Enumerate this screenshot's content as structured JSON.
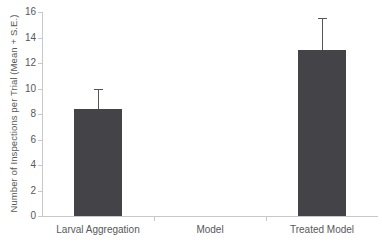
{
  "chart_data": {
    "type": "bar",
    "title": "",
    "xlabel": "",
    "ylabel": "Number of Inspections per Trial (Mean + S.E.)",
    "categories": [
      "Larval Aggregation",
      "Model",
      "Treated Model"
    ],
    "values": [
      8.4,
      0,
      13.0
    ],
    "errors": [
      1.6,
      0,
      2.5
    ],
    "ylim": [
      0,
      16
    ],
    "ytick_values": [
      0,
      2,
      4,
      6,
      8,
      10,
      12,
      14,
      16
    ],
    "ytick_labels": [
      "0",
      "2",
      "4",
      "6",
      "8",
      "10",
      "12",
      "14",
      "16"
    ],
    "grid": false,
    "legend": "none",
    "series": [
      {
        "name": "Number of Inspections per Trial",
        "values": [
          8.4,
          0,
          13.0
        ],
        "errors": [
          1.6,
          0,
          2.5
        ]
      }
    ],
    "colors": {
      "bar_fill": "#444448",
      "error_bar": "#555558",
      "axis": "#c8c8c8",
      "text": "#58585a",
      "background": "#ffffff"
    }
  },
  "axes": {
    "y_title": "Number of Inspections per Trial (Mean + S.E.)"
  }
}
